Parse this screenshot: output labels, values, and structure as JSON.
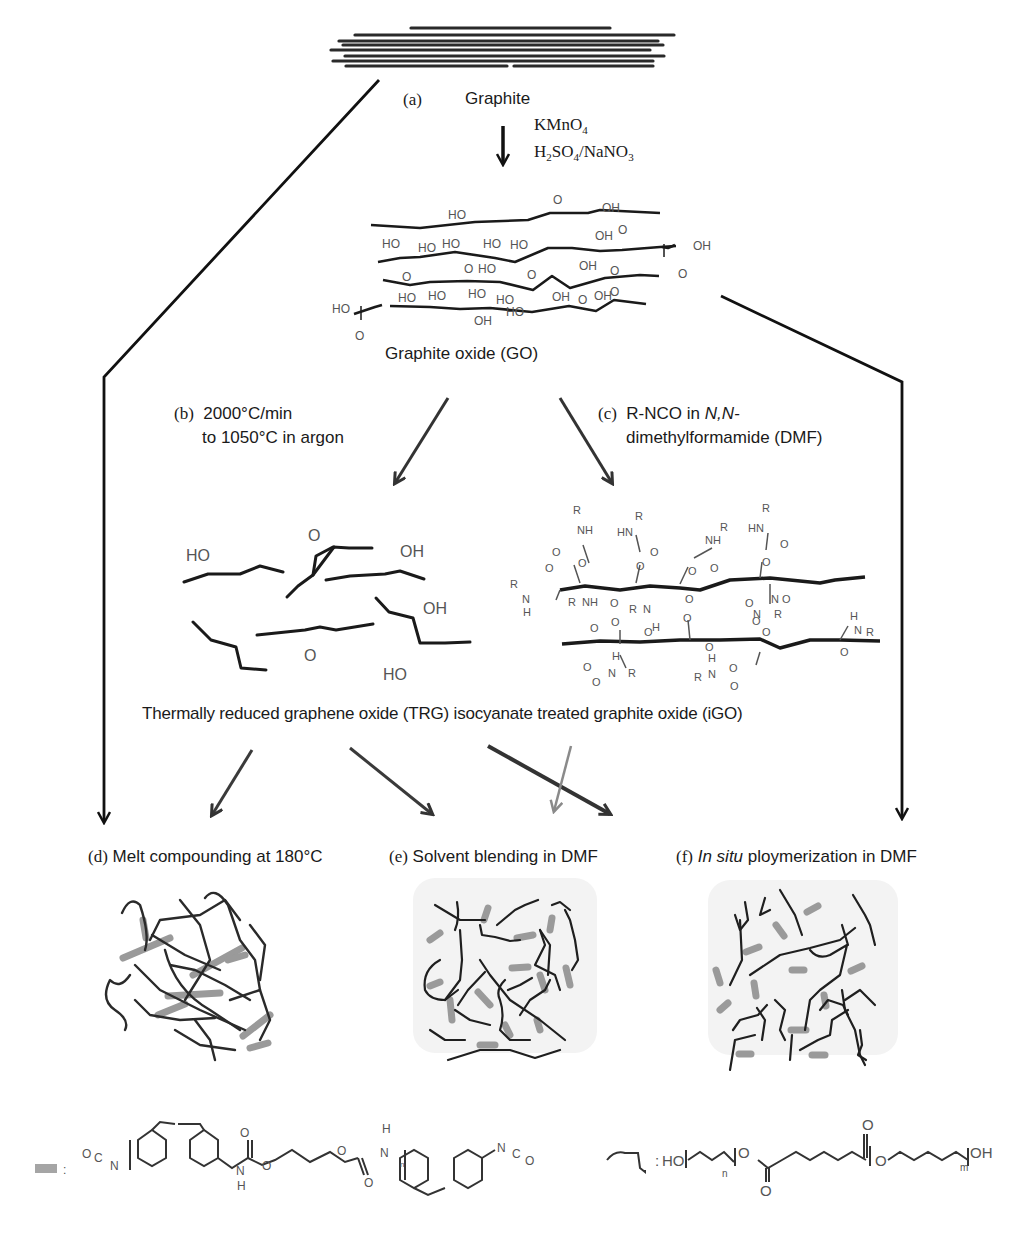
{
  "figure": {
    "graphite_label_tag": "(a)",
    "graphite_label": "Graphite",
    "reagents_a": [
      "KMnO4",
      "H2SO4/NaNO3"
    ],
    "reagent_a1_main": "KMnO",
    "reagent_a1_sub": "4",
    "reagent_a2_parts": [
      "H",
      "2",
      "SO",
      "4",
      "/NaNO",
      "3"
    ],
    "go_label": "Graphite oxide (GO)",
    "step_b": {
      "tag": "(b)",
      "line1": "2000°C/min",
      "line2": "to 1050°C in argon"
    },
    "step_c": {
      "tag": "(c)",
      "line1_prefix": "R-NCO in ",
      "line1_italic": "N,N-",
      "line2": "dimethylformamide (DMF)"
    },
    "products_label": "Thermally reduced graphene oxide (TRG) isocyanate treated graphite oxide (iGO)",
    "routes": [
      {
        "tag": "(d)",
        "label": "Melt compounding at 180°C",
        "italic_prefix": ""
      },
      {
        "tag": "(e)",
        "label": "Solvent blending in DMF",
        "italic_prefix": ""
      },
      {
        "tag": "(f)",
        "label": " ploymerization in DMF",
        "italic_prefix": "In situ"
      }
    ],
    "legend": {
      "filler_symbol": "gray-bar",
      "filler_colon": ":",
      "filler_structure": "O=C=N-[C6H4-CH2-C6H4-NH-C(=O)-O-(CH2)4-O-C(=O)-NH]n-C6H4-CH2-C6H4-N=C=O",
      "polymer_symbol": "black-chain",
      "polymer_colon": ":",
      "polymer_structure": "HO-[(CH2)4]n-O-C(=O)-(CH2)4-C(=O)-[O-(CH2)4]m-OH",
      "subscript_n": "n",
      "subscript_m": "m"
    },
    "go_groups": [
      "HO",
      "OH",
      "O",
      "HO",
      "OH",
      "O",
      "OH"
    ],
    "trg_groups": [
      "HO",
      "O",
      "OH",
      "O",
      "OH",
      "HO"
    ],
    "igo_groups": [
      "R",
      "NH",
      "HN",
      "O",
      "N",
      "H"
    ],
    "colors": {
      "ink": "#1a1a1a",
      "arrow_dark": "#333333",
      "arrow_gray": "#8a8a8a",
      "filler_gray": "#9a9a9a",
      "panel_bg": "#f4f4f4",
      "chem_text": "#555555"
    }
  }
}
